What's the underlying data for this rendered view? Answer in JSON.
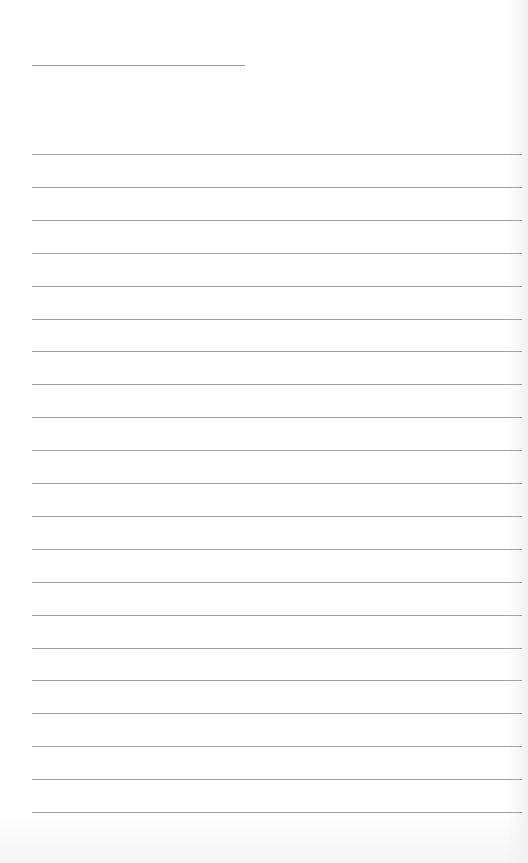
{
  "paper": {
    "type": "lined-notepaper",
    "background": "#ffffff",
    "line_color": "#a3a3a3",
    "header_line": {
      "left": 32,
      "top": 65,
      "width": 213
    },
    "rules": {
      "count": 21,
      "left": 32,
      "first_top": 154,
      "spacing": 32.9,
      "width": 490
    }
  }
}
